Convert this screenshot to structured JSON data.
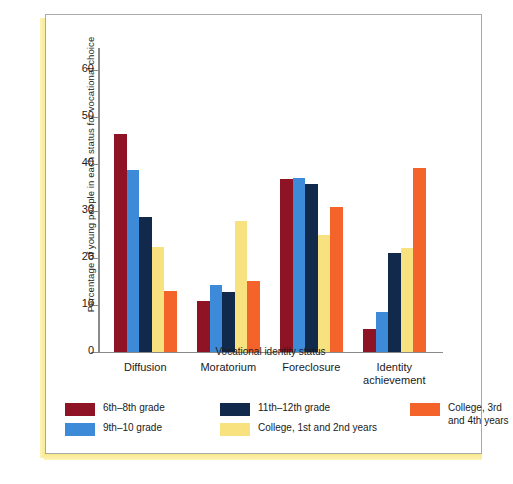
{
  "chart_data": {
    "type": "bar",
    "title": "",
    "xlabel": "Vocational identity status",
    "ylabel": "Percentage of young people in each status for vocational choice",
    "ylim": [
      0,
      65
    ],
    "yticks": [
      0,
      10,
      20,
      30,
      40,
      50,
      60
    ],
    "grid": false,
    "legend_position": "bottom",
    "categories": [
      "Diffusion",
      "Moratorium",
      "Foreclosure",
      "Identity achievement"
    ],
    "series": [
      {
        "name": "6th–8th grade",
        "color": "#8e1324",
        "values": [
          46.3,
          10.7,
          36.7,
          4.9
        ]
      },
      {
        "name": "9th–10 grade",
        "color": "#3d8ad8",
        "values": [
          38.7,
          14.2,
          37.0,
          8.5
        ]
      },
      {
        "name": "11th–12th grade",
        "color": "#11294b",
        "values": [
          28.7,
          12.6,
          35.6,
          21.0
        ]
      },
      {
        "name": "College, 1st and 2nd years",
        "color": "#f8e17f",
        "values": [
          22.3,
          27.8,
          24.9,
          22.1
        ]
      },
      {
        "name": "College, 3rd and 4th years",
        "color": "#f4642a",
        "values": [
          12.8,
          15.1,
          30.8,
          39.2
        ]
      }
    ]
  },
  "axis": {
    "y_title": "Percentage of young people in each status for vocational choice",
    "x_title": "Vocational identity status",
    "y_tick_labels": [
      "0",
      "10",
      "20",
      "30",
      "40",
      "50",
      "60"
    ]
  },
  "groups": [
    {
      "label": "Diffusion"
    },
    {
      "label": "Moratorium"
    },
    {
      "label": "Foreclosure"
    },
    {
      "label": "Identity\nachievement"
    }
  ],
  "legend": {
    "col1": [
      {
        "label": "6th–8th grade",
        "color": "#8e1324"
      },
      {
        "label": "9th–10 grade",
        "color": "#3d8ad8"
      }
    ],
    "col2": [
      {
        "label": "11th–12th grade",
        "color": "#11294b"
      },
      {
        "label": "College, 1st and 2nd years",
        "color": "#f8e17f"
      }
    ],
    "col3": [
      {
        "label": "College, 3rd\nand 4th years",
        "color": "#f4642a"
      }
    ]
  },
  "colors": {
    "frame_border": "#a9a9a9",
    "axis": "#8a8a8a",
    "accent_stripe": "#f7e479",
    "background": "#ffffff"
  }
}
